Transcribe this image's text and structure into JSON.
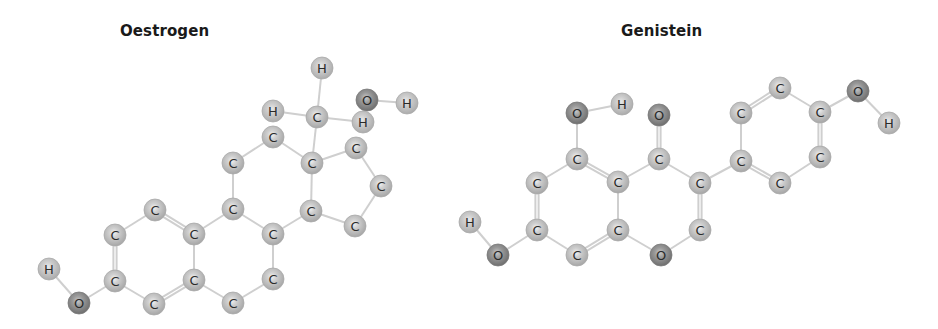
{
  "colors": {
    "C": "#b9b9b9",
    "H": "#bdbdbd",
    "O": "#8a8a8a",
    "bond": "#cfcfcf"
  },
  "atom_radius": 11,
  "molecules": [
    {
      "id": "oestrogen",
      "title": "Oestrogen",
      "atoms": [
        {
          "id": "a1",
          "el": "H",
          "x": 322,
          "y": 68
        },
        {
          "id": "a2",
          "el": "H",
          "x": 273,
          "y": 111
        },
        {
          "id": "a3",
          "el": "C",
          "x": 317,
          "y": 117
        },
        {
          "id": "a4",
          "el": "O",
          "x": 367,
          "y": 100
        },
        {
          "id": "a5",
          "el": "H",
          "x": 407,
          "y": 103
        },
        {
          "id": "a6",
          "el": "H",
          "x": 363,
          "y": 122
        },
        {
          "id": "a7",
          "el": "C",
          "x": 273,
          "y": 137
        },
        {
          "id": "a8",
          "el": "C",
          "x": 233,
          "y": 163
        },
        {
          "id": "a9",
          "el": "C",
          "x": 312,
          "y": 163
        },
        {
          "id": "a10",
          "el": "C",
          "x": 356,
          "y": 148
        },
        {
          "id": "a11",
          "el": "C",
          "x": 381,
          "y": 186
        },
        {
          "id": "a12",
          "el": "C",
          "x": 355,
          "y": 226
        },
        {
          "id": "a13",
          "el": "C",
          "x": 311,
          "y": 211
        },
        {
          "id": "a14",
          "el": "C",
          "x": 233,
          "y": 209
        },
        {
          "id": "a15",
          "el": "C",
          "x": 273,
          "y": 234
        },
        {
          "id": "a16",
          "el": "C",
          "x": 273,
          "y": 279
        },
        {
          "id": "a17",
          "el": "C",
          "x": 233,
          "y": 303
        },
        {
          "id": "a18",
          "el": "C",
          "x": 194,
          "y": 280
        },
        {
          "id": "a19",
          "el": "C",
          "x": 194,
          "y": 234
        },
        {
          "id": "a20",
          "el": "C",
          "x": 155,
          "y": 210
        },
        {
          "id": "a21",
          "el": "C",
          "x": 115,
          "y": 235
        },
        {
          "id": "a22",
          "el": "C",
          "x": 115,
          "y": 281
        },
        {
          "id": "a23",
          "el": "C",
          "x": 154,
          "y": 304
        },
        {
          "id": "a24",
          "el": "O",
          "x": 79,
          "y": 303
        },
        {
          "id": "a25",
          "el": "H",
          "x": 49,
          "y": 269
        }
      ],
      "bonds": [
        [
          "a1",
          "a3",
          1
        ],
        [
          "a2",
          "a3",
          1
        ],
        [
          "a3",
          "a6",
          1
        ],
        [
          "a3",
          "a9",
          1
        ],
        [
          "a4",
          "a5",
          1
        ],
        [
          "a7",
          "a8",
          1
        ],
        [
          "a7",
          "a9",
          1
        ],
        [
          "a9",
          "a10",
          1
        ],
        [
          "a10",
          "a11",
          1
        ],
        [
          "a11",
          "a12",
          1
        ],
        [
          "a12",
          "a13",
          1
        ],
        [
          "a13",
          "a9",
          1
        ],
        [
          "a13",
          "a15",
          1
        ],
        [
          "a8",
          "a14",
          1
        ],
        [
          "a14",
          "a15",
          1
        ],
        [
          "a14",
          "a19",
          1
        ],
        [
          "a15",
          "a16",
          1
        ],
        [
          "a16",
          "a17",
          1
        ],
        [
          "a17",
          "a18",
          1
        ],
        [
          "a18",
          "a19",
          1
        ],
        [
          "a19",
          "a20",
          2
        ],
        [
          "a20",
          "a21",
          1
        ],
        [
          "a21",
          "a22",
          2
        ],
        [
          "a22",
          "a23",
          1
        ],
        [
          "a23",
          "a18",
          2
        ],
        [
          "a22",
          "a24",
          1
        ],
        [
          "a24",
          "a25",
          1
        ]
      ]
    },
    {
      "id": "genistein",
      "title": "Genistein",
      "atoms": [
        {
          "id": "b1",
          "el": "O",
          "x": 577,
          "y": 113
        },
        {
          "id": "b2",
          "el": "H",
          "x": 622,
          "y": 104
        },
        {
          "id": "b3",
          "el": "O",
          "x": 659,
          "y": 115
        },
        {
          "id": "b4",
          "el": "C",
          "x": 741,
          "y": 113
        },
        {
          "id": "b5",
          "el": "C",
          "x": 780,
          "y": 88
        },
        {
          "id": "b6",
          "el": "C",
          "x": 820,
          "y": 112
        },
        {
          "id": "b7",
          "el": "O",
          "x": 858,
          "y": 91
        },
        {
          "id": "b8",
          "el": "H",
          "x": 889,
          "y": 123
        },
        {
          "id": "b9",
          "el": "C",
          "x": 577,
          "y": 159
        },
        {
          "id": "b10",
          "el": "C",
          "x": 659,
          "y": 159
        },
        {
          "id": "b11",
          "el": "C",
          "x": 741,
          "y": 161
        },
        {
          "id": "b12",
          "el": "C",
          "x": 820,
          "y": 157
        },
        {
          "id": "b13",
          "el": "C",
          "x": 537,
          "y": 183
        },
        {
          "id": "b14",
          "el": "C",
          "x": 618,
          "y": 182
        },
        {
          "id": "b15",
          "el": "C",
          "x": 700,
          "y": 183
        },
        {
          "id": "b16",
          "el": "C",
          "x": 780,
          "y": 183
        },
        {
          "id": "b17",
          "el": "C",
          "x": 537,
          "y": 230
        },
        {
          "id": "b18",
          "el": "C",
          "x": 618,
          "y": 230
        },
        {
          "id": "b19",
          "el": "C",
          "x": 700,
          "y": 230
        },
        {
          "id": "b20",
          "el": "C",
          "x": 577,
          "y": 255
        },
        {
          "id": "b21",
          "el": "O",
          "x": 661,
          "y": 255
        },
        {
          "id": "b22",
          "el": "O",
          "x": 498,
          "y": 255
        },
        {
          "id": "b23",
          "el": "H",
          "x": 470,
          "y": 222
        }
      ],
      "bonds": [
        [
          "b1",
          "b2",
          1
        ],
        [
          "b1",
          "b9",
          1
        ],
        [
          "b3",
          "b10",
          2
        ],
        [
          "b4",
          "b5",
          2
        ],
        [
          "b5",
          "b6",
          1
        ],
        [
          "b6",
          "b7",
          1
        ],
        [
          "b7",
          "b8",
          1
        ],
        [
          "b4",
          "b11",
          1
        ],
        [
          "b6",
          "b12",
          2
        ],
        [
          "b9",
          "b13",
          1
        ],
        [
          "b9",
          "b14",
          2
        ],
        [
          "b10",
          "b14",
          1
        ],
        [
          "b10",
          "b15",
          1
        ],
        [
          "b11",
          "b15",
          1
        ],
        [
          "b11",
          "b16",
          2
        ],
        [
          "b12",
          "b16",
          1
        ],
        [
          "b13",
          "b17",
          2
        ],
        [
          "b14",
          "b18",
          1
        ],
        [
          "b15",
          "b19",
          2
        ],
        [
          "b17",
          "b20",
          1
        ],
        [
          "b20",
          "b18",
          2
        ],
        [
          "b18",
          "b21",
          1
        ],
        [
          "b21",
          "b19",
          1
        ],
        [
          "b17",
          "b22",
          1
        ],
        [
          "b22",
          "b23",
          1
        ]
      ]
    }
  ]
}
